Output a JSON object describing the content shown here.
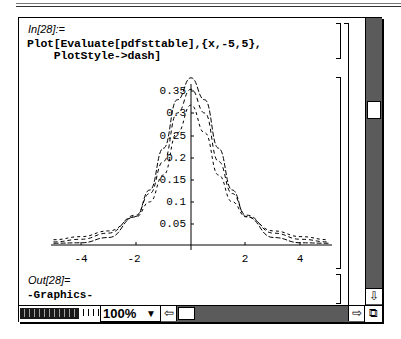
{
  "window": {
    "zoom_level": "100%"
  },
  "cell_input": {
    "label": "In[28]:=",
    "code_lines": [
      "Plot[Evaluate[pdfsttable],{x,-5,5},",
      "    PlotStyle->dash]"
    ]
  },
  "cell_output": {
    "label": "Out[28]=",
    "value": "-Graphics-"
  },
  "chart_data": {
    "type": "line",
    "title": "",
    "xlabel": "",
    "ylabel": "",
    "xlim": [
      -5,
      5
    ],
    "ylim": [
      0,
      0.38
    ],
    "x_ticks": [
      "-4",
      "-2",
      "2",
      "4"
    ],
    "y_ticks": [
      "0.05",
      "0.1",
      "0.15",
      "0.2",
      "0.25",
      "0.3",
      "0.35"
    ],
    "grid": false,
    "legend": null,
    "line_style": "dashed",
    "x": [
      -5,
      -4,
      -3,
      -2,
      -1.5,
      -1,
      -0.5,
      0,
      0.5,
      1,
      1.5,
      2,
      3,
      4,
      5
    ],
    "series": [
      {
        "name": "curve-1 (tallest)",
        "values": [
          0.004,
          0.005,
          0.017,
          0.065,
          0.125,
          0.22,
          0.33,
          0.38,
          0.33,
          0.22,
          0.125,
          0.065,
          0.017,
          0.005,
          0.004
        ]
      },
      {
        "name": "curve-2",
        "values": [
          0.007,
          0.013,
          0.027,
          0.068,
          0.117,
          0.19,
          0.3,
          0.354,
          0.3,
          0.19,
          0.117,
          0.068,
          0.027,
          0.013,
          0.007
        ]
      },
      {
        "name": "curve-3 (lowest peak)",
        "values": [
          0.012,
          0.019,
          0.032,
          0.064,
          0.098,
          0.159,
          0.255,
          0.318,
          0.255,
          0.159,
          0.098,
          0.064,
          0.032,
          0.019,
          0.012
        ]
      }
    ]
  },
  "icons": {
    "scroll_down": "⇩",
    "scroll_left": "⇦",
    "scroll_right": "⇨",
    "grow_box": "⧉",
    "dropdown": "▼"
  }
}
